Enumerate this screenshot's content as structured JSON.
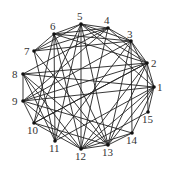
{
  "diagram": {
    "type": "undirected-graph",
    "nodes": [
      {
        "id": "1",
        "x": 154,
        "y": 87,
        "lx": 157,
        "ly": 91
      },
      {
        "id": "2",
        "x": 147,
        "y": 63,
        "lx": 151,
        "ly": 67
      },
      {
        "id": "3",
        "x": 131,
        "y": 41,
        "lx": 127,
        "ly": 38
      },
      {
        "id": "4",
        "x": 108,
        "y": 28,
        "lx": 104,
        "ly": 24
      },
      {
        "id": "5",
        "x": 81,
        "y": 24,
        "lx": 77,
        "ly": 20
      },
      {
        "id": "6",
        "x": 54,
        "y": 34,
        "lx": 50,
        "ly": 30
      },
      {
        "id": "7",
        "x": 34,
        "y": 51,
        "lx": 24,
        "ly": 55
      },
      {
        "id": "8",
        "x": 23,
        "y": 74,
        "lx": 12,
        "ly": 78
      },
      {
        "id": "9",
        "x": 23,
        "y": 101,
        "lx": 12,
        "ly": 105
      },
      {
        "id": "10",
        "x": 34,
        "y": 123,
        "lx": 27,
        "ly": 134
      },
      {
        "id": "11",
        "x": 55,
        "y": 141,
        "lx": 49,
        "ly": 152
      },
      {
        "id": "12",
        "x": 81,
        "y": 149,
        "lx": 75,
        "ly": 160
      },
      {
        "id": "13",
        "x": 108,
        "y": 145,
        "lx": 102,
        "ly": 156
      },
      {
        "id": "14",
        "x": 132,
        "y": 133,
        "lx": 126,
        "ly": 144
      },
      {
        "id": "15",
        "x": 148,
        "y": 112,
        "lx": 142,
        "ly": 123
      }
    ],
    "edges": [
      [
        "1",
        "2"
      ],
      [
        "1",
        "15"
      ],
      [
        "1",
        "14"
      ],
      [
        "1",
        "13"
      ],
      [
        "1",
        "12"
      ],
      [
        "1",
        "9"
      ],
      [
        "1",
        "8"
      ],
      [
        "1",
        "3"
      ],
      [
        "1",
        "5"
      ],
      [
        "2",
        "3"
      ],
      [
        "2",
        "4"
      ],
      [
        "2",
        "5"
      ],
      [
        "2",
        "6"
      ],
      [
        "2",
        "8"
      ],
      [
        "2",
        "9"
      ],
      [
        "2",
        "10"
      ],
      [
        "2",
        "12"
      ],
      [
        "2",
        "13"
      ],
      [
        "2",
        "15"
      ],
      [
        "3",
        "4"
      ],
      [
        "3",
        "5"
      ],
      [
        "3",
        "6"
      ],
      [
        "3",
        "11"
      ],
      [
        "3",
        "13"
      ],
      [
        "3",
        "14"
      ],
      [
        "4",
        "5"
      ],
      [
        "4",
        "6"
      ],
      [
        "4",
        "7"
      ],
      [
        "4",
        "12"
      ],
      [
        "4",
        "9"
      ],
      [
        "5",
        "6"
      ],
      [
        "5",
        "7"
      ],
      [
        "5",
        "10"
      ],
      [
        "5",
        "13"
      ],
      [
        "5",
        "12"
      ],
      [
        "6",
        "7"
      ],
      [
        "6",
        "11"
      ],
      [
        "6",
        "12"
      ],
      [
        "6",
        "13"
      ],
      [
        "7",
        "3"
      ],
      [
        "7",
        "11"
      ],
      [
        "7",
        "13"
      ],
      [
        "8",
        "9"
      ],
      [
        "8",
        "4"
      ],
      [
        "8",
        "12"
      ],
      [
        "8",
        "13"
      ],
      [
        "8",
        "11"
      ],
      [
        "9",
        "3"
      ],
      [
        "9",
        "10"
      ],
      [
        "9",
        "12"
      ],
      [
        "9",
        "14"
      ],
      [
        "10",
        "2"
      ],
      [
        "10",
        "12"
      ],
      [
        "10",
        "6"
      ],
      [
        "11",
        "1"
      ],
      [
        "11",
        "5"
      ],
      [
        "12",
        "13"
      ],
      [
        "12",
        "14"
      ],
      [
        "12",
        "15"
      ],
      [
        "13",
        "14"
      ],
      [
        "13",
        "10"
      ]
    ]
  }
}
